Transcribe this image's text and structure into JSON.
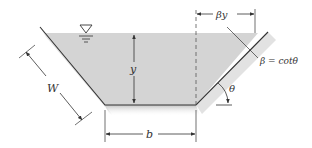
{
  "figure": {
    "type": "trapezoidal channel cross-section",
    "labels": {
      "depth": "y",
      "bottom_width": "b",
      "wetted_side": "W",
      "side_offset": "βy",
      "side_slope_def": "β = cotθ",
      "angle": "θ"
    },
    "symbols": {
      "free_surface": "water-surface-triangle"
    },
    "colors": {
      "water": "#d4d4d4",
      "bank_shadow": "#cfcfcf",
      "line": "#333333"
    }
  }
}
